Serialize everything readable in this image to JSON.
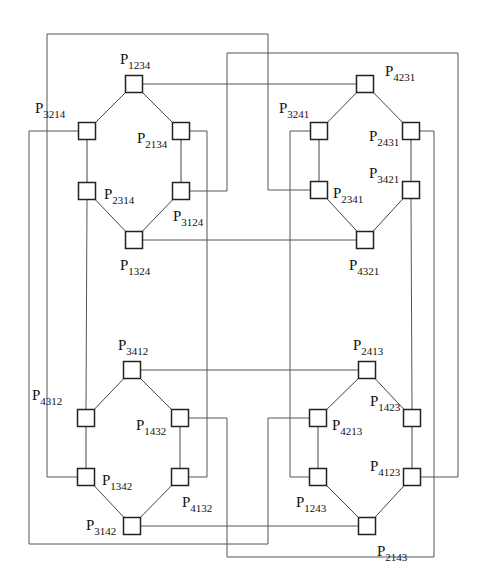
{
  "diagram": {
    "type": "interconnection-network",
    "node_size": 17,
    "colors": {
      "wire": "#555555",
      "node_border": "#222222",
      "background": "#ffffff"
    },
    "nodes": [
      {
        "id": "P1234",
        "sub": "1234",
        "x": 134,
        "y": 84,
        "lx": -14,
        "ly": -20
      },
      {
        "id": "P3214",
        "sub": "3214",
        "x": 87,
        "y": 131,
        "lx": -52,
        "ly": -18
      },
      {
        "id": "P2134",
        "sub": "2134",
        "x": 181,
        "y": 131,
        "lx": -44,
        "ly": 12
      },
      {
        "id": "P2314",
        "sub": "2314",
        "x": 87,
        "y": 191,
        "lx": 17,
        "ly": 8
      },
      {
        "id": "P3124",
        "sub": "3124",
        "x": 181,
        "y": 191,
        "lx": -8,
        "ly": 30
      },
      {
        "id": "P1324",
        "sub": "1324",
        "x": 134,
        "y": 240,
        "lx": -14,
        "ly": 30
      },
      {
        "id": "P4231",
        "sub": "4231",
        "x": 365,
        "y": 84,
        "lx": 20,
        "ly": -8
      },
      {
        "id": "P3241",
        "sub": "3241",
        "x": 319,
        "y": 131,
        "lx": -40,
        "ly": -18
      },
      {
        "id": "P2431",
        "sub": "2431",
        "x": 411,
        "y": 131,
        "lx": -42,
        "ly": 10
      },
      {
        "id": "P2341",
        "sub": "2341",
        "x": 319,
        "y": 190,
        "lx": 14,
        "ly": 8
      },
      {
        "id": "P3421",
        "sub": "3421",
        "x": 411,
        "y": 190,
        "lx": -42,
        "ly": -12
      },
      {
        "id": "P4321",
        "sub": "4321",
        "x": 365,
        "y": 240,
        "lx": -16,
        "ly": 30
      },
      {
        "id": "P3412",
        "sub": "3412",
        "x": 132,
        "y": 370,
        "lx": -14,
        "ly": -20
      },
      {
        "id": "P4312",
        "sub": "4312",
        "x": 86,
        "y": 418,
        "lx": -54,
        "ly": -18
      },
      {
        "id": "P1432",
        "sub": "1432",
        "x": 180,
        "y": 418,
        "lx": -44,
        "ly": 12
      },
      {
        "id": "P1342",
        "sub": "1342",
        "x": 86,
        "y": 477,
        "lx": 16,
        "ly": 8
      },
      {
        "id": "P4132",
        "sub": "4132",
        "x": 180,
        "y": 477,
        "lx": 2,
        "ly": 30
      },
      {
        "id": "P3142",
        "sub": "3142",
        "x": 132,
        "y": 526,
        "lx": -46,
        "ly": 4
      },
      {
        "id": "P2413",
        "sub": "2413",
        "x": 367,
        "y": 370,
        "lx": -14,
        "ly": -20
      },
      {
        "id": "P4213",
        "sub": "4213",
        "x": 318,
        "y": 418,
        "lx": 14,
        "ly": 12
      },
      {
        "id": "P1423",
        "sub": "1423",
        "x": 412,
        "y": 418,
        "lx": -42,
        "ly": -12
      },
      {
        "id": "P1243",
        "sub": "1243",
        "x": 318,
        "y": 477,
        "lx": -22,
        "ly": 30
      },
      {
        "id": "P4123",
        "sub": "4123",
        "x": 412,
        "y": 477,
        "lx": -42,
        "ly": -6
      },
      {
        "id": "P2143",
        "sub": "2143",
        "x": 367,
        "y": 526,
        "lx": 10,
        "ly": 30
      }
    ],
    "cluster_edges": [
      [
        "P1234",
        "P3214"
      ],
      [
        "P1234",
        "P2134"
      ],
      [
        "P3214",
        "P2314"
      ],
      [
        "P2134",
        "P3124"
      ],
      [
        "P2314",
        "P1324"
      ],
      [
        "P3124",
        "P1324"
      ],
      [
        "P4231",
        "P3241"
      ],
      [
        "P4231",
        "P2431"
      ],
      [
        "P3241",
        "P2341"
      ],
      [
        "P2431",
        "P3421"
      ],
      [
        "P2341",
        "P4321"
      ],
      [
        "P3421",
        "P4321"
      ],
      [
        "P3412",
        "P4312"
      ],
      [
        "P3412",
        "P1432"
      ],
      [
        "P4312",
        "P1342"
      ],
      [
        "P1432",
        "P4132"
      ],
      [
        "P1342",
        "P3142"
      ],
      [
        "P4132",
        "P3142"
      ],
      [
        "P2413",
        "P4213"
      ],
      [
        "P2413",
        "P1423"
      ],
      [
        "P4213",
        "P1243"
      ],
      [
        "P1423",
        "P4123"
      ],
      [
        "P1243",
        "P2143"
      ],
      [
        "P4123",
        "P2143"
      ]
    ],
    "wires": [
      {
        "from": "P1234",
        "to": "P4231",
        "points": [
          [
            143,
            84
          ],
          [
            356,
            84
          ]
        ]
      },
      {
        "from": "P1324",
        "to": "P4321",
        "points": [
          [
            143,
            240
          ],
          [
            356,
            240
          ]
        ]
      },
      {
        "from": "P3412",
        "to": "P2413",
        "points": [
          [
            141,
            370
          ],
          [
            358,
            370
          ]
        ]
      },
      {
        "from": "P3142",
        "to": "P2143",
        "points": [
          [
            141,
            526
          ],
          [
            358,
            526
          ]
        ]
      },
      {
        "from": "P2314",
        "to": "P4312",
        "points": [
          [
            87,
            200
          ],
          [
            86,
            409
          ]
        ]
      },
      {
        "from": "P3421",
        "to": "P1423",
        "points": [
          [
            411,
            199
          ],
          [
            412,
            409
          ]
        ]
      },
      {
        "from": "P2134",
        "to": "P4132",
        "points": [
          [
            190,
            131
          ],
          [
            207,
            131
          ],
          [
            207,
            477
          ],
          [
            189,
            477
          ]
        ]
      },
      {
        "from": "P3241",
        "to": "P1243",
        "points": [
          [
            310,
            131
          ],
          [
            290,
            131
          ],
          [
            290,
            477
          ],
          [
            309,
            477
          ]
        ]
      },
      {
        "from": "P1342",
        "to": "P2341",
        "points": [
          [
            77,
            477
          ],
          [
            47,
            477
          ],
          [
            47,
            34
          ],
          [
            268,
            34
          ],
          [
            268,
            190
          ],
          [
            310,
            190
          ]
        ]
      },
      {
        "from": "P3214",
        "to": "P4213",
        "points": [
          [
            78,
            131
          ],
          [
            29,
            131
          ],
          [
            29,
            544
          ],
          [
            268,
            544
          ],
          [
            268,
            418
          ],
          [
            309,
            418
          ]
        ]
      },
      {
        "from": "P3124",
        "to": "P4123",
        "points": [
          [
            190,
            191
          ],
          [
            227,
            191
          ],
          [
            227,
            53
          ],
          [
            458,
            53
          ],
          [
            458,
            477
          ],
          [
            421,
            477
          ]
        ]
      },
      {
        "from": "P2431",
        "to": "P1432",
        "points": [
          [
            420,
            131
          ],
          [
            434,
            131
          ],
          [
            434,
            557
          ],
          [
            227,
            557
          ],
          [
            227,
            418
          ],
          [
            189,
            418
          ]
        ]
      }
    ]
  }
}
